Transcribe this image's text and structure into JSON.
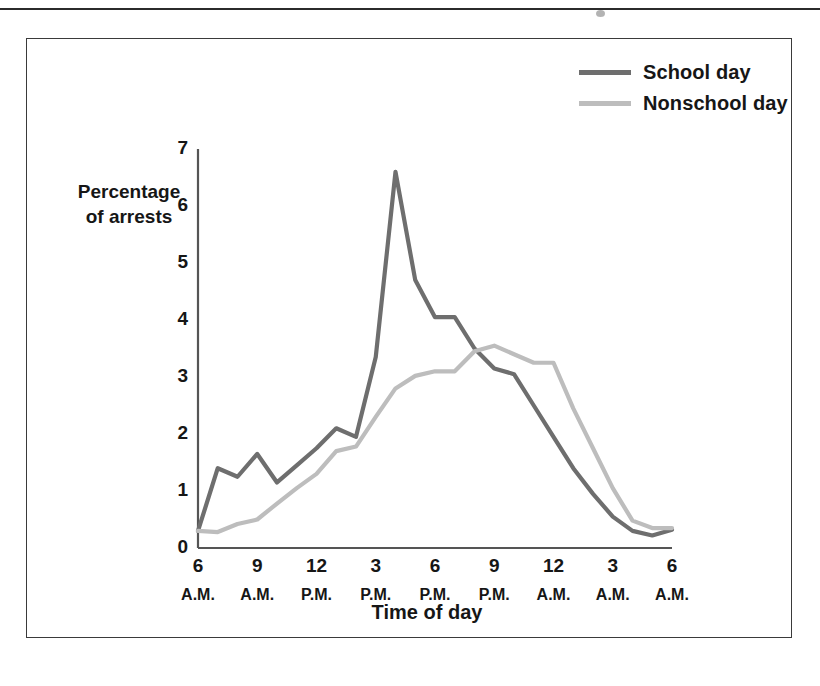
{
  "figure": {
    "y_axis_title_line1": "Percentage",
    "y_axis_title_line2": "of arrests",
    "x_axis_title": "Time of day"
  },
  "legend": {
    "items": [
      {
        "label": "School day",
        "color": "#6e6e6e"
      },
      {
        "label": "Nonschool day",
        "color": "#bdbdbd"
      }
    ]
  },
  "chart_data": {
    "type": "line",
    "title": "",
    "xlabel": "Time of day",
    "ylabel": "Percentage of arrests",
    "ylim": [
      0,
      7
    ],
    "yticks": [
      "0",
      "1",
      "2",
      "3",
      "4",
      "5",
      "6",
      "7"
    ],
    "xtick_numbers": [
      "6",
      "9",
      "12",
      "3",
      "6",
      "9",
      "12",
      "3",
      "6"
    ],
    "xtick_meridiems": [
      "A.M.",
      "A.M.",
      "P.M.",
      "P.M.",
      "P.M.",
      "P.M.",
      "A.M.",
      "A.M.",
      "A.M."
    ],
    "grid": false,
    "legend_position": "top-right",
    "x": [
      "6 A.M.",
      "7 A.M.",
      "8 A.M.",
      "9 A.M.",
      "10 A.M.",
      "11 A.M.",
      "12 P.M.",
      "1 P.M.",
      "2 P.M.",
      "3 P.M.",
      "4 P.M.",
      "5 P.M.",
      "6 P.M.",
      "7 P.M.",
      "8 P.M.",
      "9 P.M.",
      "10 P.M.",
      "11 P.M.",
      "12 A.M.",
      "1 A.M.",
      "2 A.M.",
      "3 A.M.",
      "4 A.M.",
      "5 A.M.",
      "6 A.M."
    ],
    "series": [
      {
        "name": "School day",
        "color": "#6e6e6e",
        "values": [
          0.3,
          1.4,
          1.25,
          1.65,
          1.15,
          1.45,
          1.75,
          2.1,
          1.95,
          3.35,
          6.6,
          4.7,
          4.05,
          4.05,
          3.5,
          3.15,
          3.05,
          2.5,
          1.95,
          1.4,
          0.95,
          0.55,
          0.3,
          0.22,
          0.32
        ]
      },
      {
        "name": "Nonschool day",
        "color": "#bdbdbd",
        "values": [
          0.3,
          0.28,
          0.42,
          0.5,
          0.78,
          1.05,
          1.3,
          1.7,
          1.78,
          2.3,
          2.8,
          3.02,
          3.1,
          3.1,
          3.45,
          3.55,
          3.4,
          3.25,
          3.25,
          2.45,
          1.75,
          1.05,
          0.48,
          0.35,
          0.35
        ]
      }
    ]
  }
}
